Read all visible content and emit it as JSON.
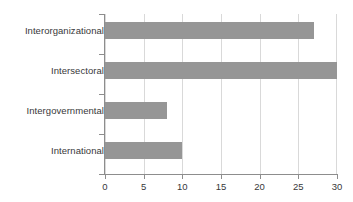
{
  "chart_data": {
    "type": "bar",
    "orientation": "horizontal",
    "title": "",
    "subtitle": "",
    "xlabel": "",
    "ylabel": "",
    "categories": [
      "Interorganizational",
      "Intersectoral",
      "Intergovernmental",
      "International"
    ],
    "values": [
      27,
      30,
      8,
      10
    ],
    "series": [
      {
        "name": "",
        "values": [
          27,
          30,
          8,
          10
        ]
      }
    ],
    "xlim": [
      0,
      30
    ],
    "xticks": [
      0,
      5,
      10,
      15,
      20,
      25,
      30
    ],
    "xtick_labels": [
      "0",
      "5",
      "10",
      "15",
      "20",
      "25",
      "30"
    ],
    "grid": "vertical",
    "legend": "none",
    "annotations": [],
    "colors": {
      "bar_fill": "#969696",
      "gridline": "#d9d9d9",
      "axis": "#8d8d8d",
      "text": "#38383a",
      "background": "#ffffff"
    }
  }
}
